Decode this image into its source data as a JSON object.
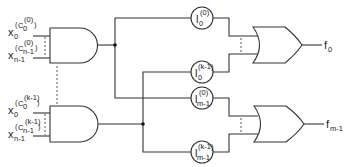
{
  "diagram": {
    "type": "logic-circuit",
    "and_gates": [
      {
        "id": "and-0",
        "inputs": [
          {
            "var": "x",
            "sub": "0",
            "sup_c": "C",
            "sup_c_sub": "0",
            "sup_c_sup": "(0)"
          },
          {
            "var": "x",
            "sub": "n-1",
            "sup_c": "C",
            "sup_c_sub": "n-1",
            "sup_c_sup": "(0)"
          }
        ]
      },
      {
        "id": "and-k-1",
        "inputs": [
          {
            "var": "x",
            "sub": "0",
            "sup_c": "C",
            "sup_c_sub": "0",
            "sup_c_sup": "(k-1)"
          },
          {
            "var": "x",
            "sub": "n-1",
            "sup_c": "C",
            "sup_c_sub": "n-1",
            "sup_c_sup": "(k-1)"
          }
        ]
      }
    ],
    "weights": [
      {
        "var": "l",
        "sup": "(0)",
        "sub": "0"
      },
      {
        "var": "l",
        "sup": "(k-1)",
        "sub": "0"
      },
      {
        "var": "l",
        "sup": "(0)",
        "sub": "m-1"
      },
      {
        "var": "l",
        "sup": "(k-1)",
        "sub": "m-1"
      }
    ],
    "or_gates": [
      {
        "id": "or-0",
        "output": {
          "var": "f",
          "sub": "0"
        }
      },
      {
        "id": "or-m-1",
        "output": {
          "var": "f",
          "sub": "m-1"
        }
      }
    ]
  }
}
